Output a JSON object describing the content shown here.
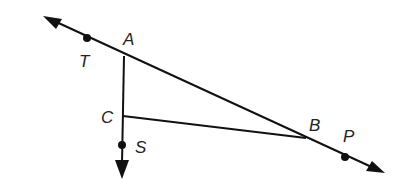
{
  "diagram": {
    "points": {
      "T": {
        "label": "T",
        "x": 87,
        "y": 38
      },
      "A": {
        "label": "A",
        "x": 124,
        "y": 56
      },
      "C": {
        "label": "C",
        "x": 123,
        "y": 116
      },
      "S": {
        "label": "S",
        "x": 122,
        "y": 145
      },
      "B": {
        "label": "B",
        "x": 306,
        "y": 138
      },
      "P": {
        "label": "P",
        "x": 345,
        "y": 157
      }
    },
    "stroke_color": "#111111"
  }
}
